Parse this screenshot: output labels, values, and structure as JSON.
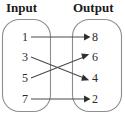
{
  "diagram": {
    "title_left": "Input",
    "title_right": "Output",
    "type": "mapping-diagram",
    "colors": {
      "outline": "#8d8d8d",
      "arrow": "#2f2f2f",
      "text": "#1a1a1a",
      "background": "#ffffff"
    },
    "input_set": {
      "label": "Input",
      "values": [
        "1",
        "3",
        "5",
        "7"
      ]
    },
    "output_set": {
      "label": "Output",
      "values": [
        "8",
        "6",
        "4",
        "2"
      ]
    },
    "mappings": [
      {
        "from": "1",
        "to": "8",
        "crossing": false
      },
      {
        "from": "3",
        "to": "4",
        "crossing": true
      },
      {
        "from": "5",
        "to": "6",
        "crossing": true
      },
      {
        "from": "7",
        "to": "2",
        "crossing": false
      }
    ]
  }
}
